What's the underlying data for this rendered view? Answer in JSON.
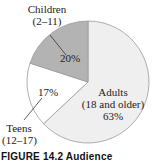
{
  "chart_data": {
    "type": "pie",
    "title": "",
    "categories": [
      "Adults (18 and older)",
      "Teens (12–17)",
      "Children (2–11)"
    ],
    "values": [
      63,
      17,
      20
    ],
    "unit": "%",
    "colors": [
      "#efefef",
      "#ffffff",
      "#b3b3b3"
    ],
    "slices": [
      {
        "name": "Adults",
        "range": "(18 and older)",
        "value": 63,
        "label": "63%",
        "color": "#efefef"
      },
      {
        "name": "Teens",
        "range": "(12–17)",
        "value": 17,
        "label": "17%",
        "color": "#ffffff"
      },
      {
        "name": "Children",
        "range": "(2–11)",
        "value": 20,
        "label": "20%",
        "color": "#b3b3b3"
      }
    ],
    "legend": "none (direct labels)"
  },
  "labels": {
    "children_name": "Children",
    "children_range": "(2–11)",
    "children_pct": "20%",
    "teens_name": "Teens",
    "teens_range": "(12–17)",
    "teens_pct": "17%",
    "adults_name": "Adults",
    "adults_range": "(18 and older)",
    "adults_pct": "63%"
  },
  "caption": "FIGURE 14.2 Audience"
}
